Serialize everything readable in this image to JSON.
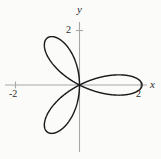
{
  "figure": {
    "background_color": "#fbfbfa",
    "width": 161,
    "height": 159
  },
  "axes": {
    "x_label": "x",
    "y_label": "y",
    "axis_color": "#a8a8a8",
    "curve_color": "#1a1a1a",
    "origin_px": [
      79,
      85
    ],
    "ticks": {
      "x": [
        {
          "value": -2,
          "label": "-2",
          "px": 15
        },
        {
          "value": 2,
          "label": "2",
          "px": 140
        }
      ],
      "y": [
        {
          "value": 2,
          "label": "2",
          "px": 30
        }
      ]
    }
  },
  "chart_data": {
    "type": "line",
    "plot_kind": "polar-rose",
    "title": "",
    "xlabel": "x",
    "ylabel": "y",
    "xlim": [
      -2.6,
      2.6
    ],
    "ylim": [
      -2.35,
      2.85
    ],
    "grid": false,
    "legend": null,
    "equation": "r = 2 sin(3θ)",
    "petal_count": 3,
    "petal_length": 2,
    "petal_tip_angles_deg": [
      150,
      30,
      270
    ],
    "petal_tips_xy": [
      [
        -1.73,
        1.0
      ],
      [
        1.73,
        1.0
      ],
      [
        0.0,
        -2.0
      ]
    ],
    "x_ticks": [
      -2,
      2
    ],
    "y_ticks": [
      2
    ],
    "x_tick_labels": [
      "-2",
      "2"
    ],
    "y_tick_labels": [
      "2"
    ],
    "series": [
      {
        "name": "rose curve",
        "color": "#1a1a1a",
        "linewidth": 1.4,
        "theta_deg": [
          0,
          10,
          20,
          30,
          40,
          50,
          60,
          70,
          80,
          90,
          100,
          110,
          120,
          130,
          140,
          150,
          160,
          170,
          180,
          190,
          200,
          210,
          220,
          230,
          240,
          250,
          260,
          270,
          280,
          290,
          300,
          310,
          320,
          330,
          340,
          350,
          360
        ],
        "r": [
          0,
          1.0,
          1.73,
          2.0,
          1.73,
          1.0,
          0,
          -1.0,
          -1.73,
          -2.0,
          -1.73,
          -1.0,
          0,
          1.0,
          1.73,
          2.0,
          1.73,
          1.0,
          0,
          -1.0,
          -1.73,
          -2.0,
          -1.73,
          -1.0,
          0,
          1.0,
          1.73,
          2.0,
          1.73,
          1.0,
          0,
          -1.0,
          -1.73,
          -2.0,
          -1.73,
          -1.0,
          0
        ]
      }
    ]
  }
}
